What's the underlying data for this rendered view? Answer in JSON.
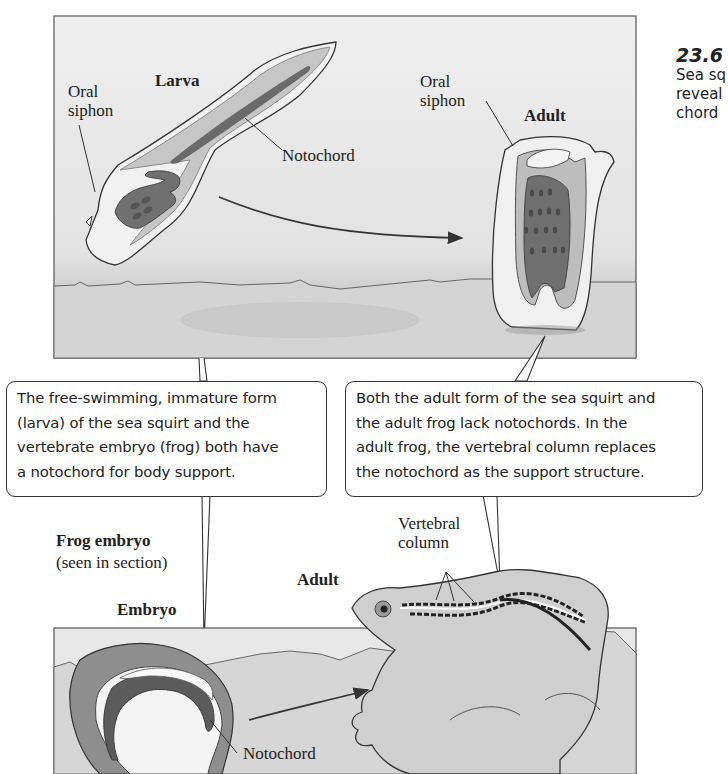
{
  "figure": {
    "number": "23.6",
    "caption_lines": [
      "Sea sq",
      "reveal",
      "chord"
    ]
  },
  "top_panel": {
    "larva": {
      "title": "Larva",
      "oral_siphon_label_lines": [
        "Oral",
        "siphon"
      ],
      "notochord_label": "Notochord"
    },
    "adult": {
      "title": "Adult",
      "oral_siphon_label_lines": [
        "Oral",
        "siphon"
      ]
    }
  },
  "callouts": [
    {
      "lines": [
        "The free-swimming, immature form",
        "(larva) of the sea squirt and the",
        "vertebrate embryo (frog) both have",
        "a notochord for body support."
      ]
    },
    {
      "lines": [
        "Both the adult form of the sea squirt and",
        "the adult frog lack notochords. In the",
        "adult frog, the vertebral column replaces",
        "the notochord as the support structure."
      ]
    }
  ],
  "bottom_panel": {
    "frog_embryo_title": "Frog embryo",
    "frog_embryo_subtitle": "(seen in section)",
    "embryo_label": "Embryo",
    "embryo_notochord_label": "Notochord",
    "adult_label": "Adult",
    "vertebral_column_label_lines": [
      "Vertebral",
      "column"
    ]
  },
  "colors": {
    "panel_bg": "#e9e9e9",
    "ground": "#d2d2d2",
    "dark_tissue": "#6e6e6e",
    "mid_tissue": "#b4b4b4",
    "outline": "#333333"
  }
}
